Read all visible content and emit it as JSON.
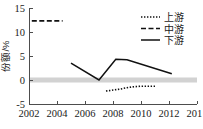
{
  "chart_data": {
    "type": "line",
    "title": "",
    "xlabel": "",
    "ylabel": "份额/%",
    "xlim": [
      2002,
      2014
    ],
    "ylim": [
      -5,
      15
    ],
    "xticks": [
      "2002",
      "2004",
      "2006",
      "2008",
      "2010",
      "2012",
      "2014"
    ],
    "xtick_values": [
      2002,
      2004,
      2006,
      2008,
      2010,
      2012,
      2014
    ],
    "yticks": [
      "15",
      "10",
      "5",
      "0",
      "-5"
    ],
    "ytick_values": [
      15,
      10,
      5,
      0,
      -5
    ],
    "grid": false,
    "zero_reference_band": true,
    "legend_position": "top-right",
    "series": [
      {
        "name": "上游",
        "style": "dotted",
        "x": [
          2007.5,
          2008.0,
          2008.5,
          2009.0,
          2009.5,
          2010.0,
          2010.5,
          2011.0
        ],
        "values": [
          -2.3,
          -2.1,
          -1.9,
          -1.6,
          -1.4,
          -1.3,
          -1.3,
          -1.3
        ]
      },
      {
        "name": "中游",
        "style": "dashed",
        "x": [
          2002.2,
          2004.4
        ],
        "values": [
          12.3,
          12.3
        ]
      },
      {
        "name": "下游",
        "style": "solid",
        "x": [
          2005.0,
          2007.0,
          2008.2,
          2009.0,
          2012.2
        ],
        "values": [
          3.5,
          0.0,
          4.3,
          4.2,
          1.3
        ]
      }
    ]
  },
  "legend": {
    "items": [
      {
        "label": "上游",
        "style": "dotted"
      },
      {
        "label": "中游",
        "style": "dashed"
      },
      {
        "label": "下游",
        "style": "solid"
      }
    ]
  },
  "axes": {
    "y_title": "份额/%"
  },
  "colors": {
    "line": "#111111",
    "axis": "#4d4d4d",
    "zero_band": "#d2d2d2",
    "background": "#ffffff"
  }
}
